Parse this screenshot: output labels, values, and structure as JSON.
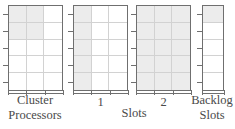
{
  "figure": {
    "type": "schematic-resource-grid",
    "background": "#ffffff",
    "fill_color": "#ececec",
    "border_color": "#6f6f6f",
    "gridline_color": "#d2d2d2",
    "text_color": "#4a4a4a",
    "axis": {
      "x_label": "Slots",
      "y_tick_count": 5,
      "x_tick_count_per_box": 4
    },
    "boxes": [
      {
        "id": "cluster-processors",
        "label_line1": "Cluster",
        "label_line2": "Processors",
        "tick_label": "",
        "columns": 3,
        "rows": 5,
        "filled_cells": [
          [
            true,
            true,
            false
          ],
          [
            true,
            true,
            false
          ],
          [
            false,
            false,
            false
          ],
          [
            false,
            false,
            false
          ],
          [
            false,
            false,
            false
          ]
        ]
      },
      {
        "id": "slots-1",
        "label_line1": "",
        "label_line2": "",
        "tick_label": "1",
        "columns": 3,
        "rows": 5,
        "filled_cells": [
          [
            true,
            false,
            false
          ],
          [
            true,
            false,
            false
          ],
          [
            true,
            false,
            false
          ],
          [
            true,
            false,
            false
          ],
          [
            true,
            false,
            false
          ]
        ]
      },
      {
        "id": "slots-2",
        "label_line1": "",
        "label_line2": "",
        "tick_label": "2",
        "columns": 3,
        "rows": 5,
        "filled_cells": [
          [
            true,
            true,
            true
          ],
          [
            true,
            true,
            true
          ],
          [
            true,
            true,
            true
          ],
          [
            true,
            true,
            true
          ],
          [
            true,
            true,
            true
          ]
        ]
      },
      {
        "id": "backlog-slots",
        "label_line1": "Backlog",
        "label_line2": "Slots",
        "tick_label": "",
        "columns": 1,
        "rows": 5,
        "filled_cells": [
          [
            true
          ],
          [
            false
          ],
          [
            false
          ],
          [
            false
          ],
          [
            false
          ]
        ]
      }
    ]
  },
  "chart_data": {
    "type": "heatmap",
    "title": "",
    "xlabel": "Slots",
    "ylabel": "",
    "categories": [
      "Cluster Processors",
      "1",
      "2",
      "Backlog Slots"
    ],
    "tick_labels": [
      "",
      "1",
      "2",
      ""
    ],
    "grid": true,
    "legend": "none",
    "series": [
      {
        "name": "Cluster Processors",
        "columns": 3,
        "rows": 5,
        "filled_count": 4
      },
      {
        "name": "Slots 1",
        "columns": 3,
        "rows": 5,
        "filled_count": 5
      },
      {
        "name": "Slots 2",
        "columns": 3,
        "rows": 5,
        "filled_count": 15
      },
      {
        "name": "Backlog Slots",
        "columns": 1,
        "rows": 5,
        "filled_count": 1
      }
    ]
  }
}
